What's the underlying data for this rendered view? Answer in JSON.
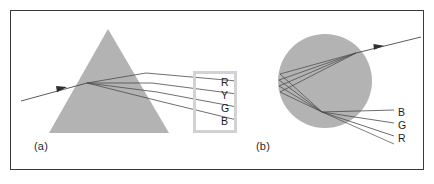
{
  "figure": {
    "border_color": "#3a3a3a",
    "background": "#ffffff"
  },
  "panel_a": {
    "label": "(a)",
    "object": "triangular-prism",
    "fill_color": "#b3b3b3",
    "apex": {
      "x": 108,
      "y": 29
    },
    "base_left": {
      "x": 49,
      "y": 133
    },
    "base_right": {
      "x": 169,
      "y": 133
    },
    "incident_ray": {
      "from": {
        "x": 21,
        "y": 101
      },
      "to": {
        "x": 86,
        "y": 83
      },
      "arrow_at": {
        "x": 62,
        "y": 89
      }
    },
    "dispersed_rays": [
      {
        "name": "R",
        "exit": {
          "x": 146,
          "y": 73
        },
        "end": {
          "x": 237,
          "y": 81
        }
      },
      {
        "name": "Y",
        "exit": {
          "x": 152,
          "y": 83
        },
        "end": {
          "x": 237,
          "y": 94
        }
      },
      {
        "name": "G",
        "exit": {
          "x": 157,
          "y": 92
        },
        "end": {
          "x": 237,
          "y": 107
        }
      },
      {
        "name": "B",
        "exit": {
          "x": 163,
          "y": 102
        },
        "end": {
          "x": 237,
          "y": 120
        }
      }
    ],
    "legend_box": {
      "border_color": "#d2d2d2",
      "letters": [
        "R",
        "Y",
        "G",
        "B"
      ]
    }
  },
  "panel_b": {
    "label": "(b)",
    "object": "spherical-droplet",
    "fill_color": "#b3b3b3",
    "circle": {
      "cx": 325,
      "cy": 81,
      "r": 47
    },
    "incident_ray": {
      "from": {
        "x": 421,
        "y": 37
      },
      "to": {
        "x": 357,
        "y": 53
      },
      "arrow_at": {
        "x": 379,
        "y": 47
      }
    },
    "exit_rays": [
      {
        "name": "B",
        "end": {
          "x": 394,
          "y": 110
        }
      },
      {
        "name": "G",
        "end": {
          "x": 394,
          "y": 123
        }
      },
      {
        "name": "R",
        "end": {
          "x": 394,
          "y": 136
        }
      }
    ],
    "labels": [
      "B",
      "G",
      "R"
    ]
  },
  "colors": {
    "shape_gray": "#b3b3b3",
    "ray_stroke": "#4a4a4a",
    "text": "#1d1d1d",
    "legend_border": "#d2d2d2",
    "frame": "#3a3a3a"
  }
}
